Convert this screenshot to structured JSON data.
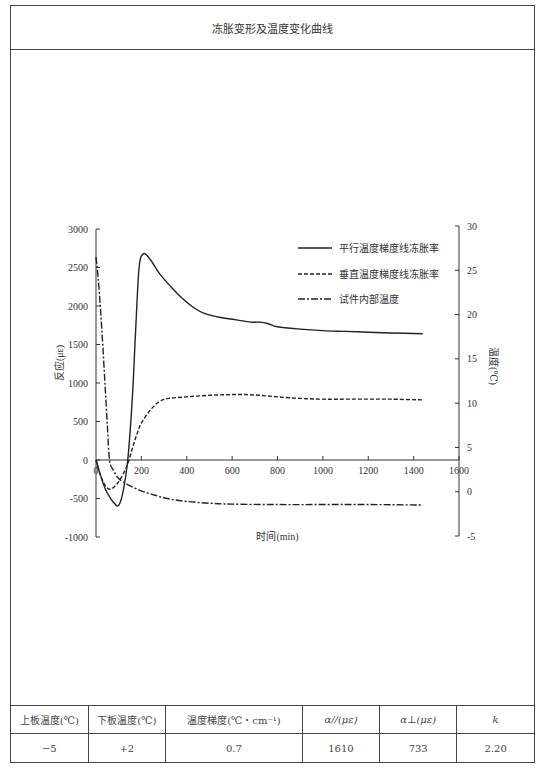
{
  "page": {
    "title": "冻胀变形及温度变化曲线"
  },
  "chart_data": {
    "type": "line",
    "title": "冻胀变形及温度变化曲线",
    "xlabel": "时间(min)",
    "ylabel": "反应(με)",
    "y2label": "温度(℃)",
    "xlim": [
      0,
      1600
    ],
    "ylim": [
      -1000,
      3000
    ],
    "y2lim": [
      -5,
      30
    ],
    "xticks": [
      0,
      200,
      400,
      600,
      800,
      1000,
      1200,
      1400,
      1600
    ],
    "xtick_labels": [
      "0",
      "200",
      "400",
      "600",
      "800",
      "1000",
      "1200",
      "1400",
      "1600"
    ],
    "yticks": [
      -1000,
      -500,
      0,
      500,
      1000,
      1500,
      2000,
      2500,
      3000
    ],
    "ytick_labels": [
      "-1000",
      "-500",
      "0",
      "500",
      "1000",
      "1500",
      "2000",
      "2500",
      "3000"
    ],
    "y2ticks": [
      -5,
      0,
      5,
      10,
      15,
      20,
      25,
      30
    ],
    "y2tick_labels": [
      "-5",
      "0",
      "5",
      "10",
      "15",
      "20",
      "25",
      "30"
    ],
    "grid": false,
    "legend_position": "top-right",
    "series": [
      {
        "name": "平行温度梯度线冻胀率",
        "axis": "left",
        "style": "solid",
        "x": [
          0,
          20,
          40,
          60,
          80,
          100,
          120,
          140,
          160,
          175,
          190,
          210,
          240,
          280,
          330,
          380,
          430,
          480,
          550,
          620,
          680,
          720,
          760,
          800,
          900,
          1000,
          1100,
          1200,
          1300,
          1440
        ],
        "y": [
          0,
          -200,
          -370,
          -480,
          -560,
          -590,
          -400,
          0,
          800,
          1700,
          2500,
          2680,
          2600,
          2420,
          2250,
          2100,
          1980,
          1900,
          1850,
          1820,
          1790,
          1790,
          1770,
          1730,
          1700,
          1680,
          1670,
          1660,
          1650,
          1640
        ]
      },
      {
        "name": "垂直温度梯度线冻胀率",
        "axis": "left",
        "style": "dashed",
        "x": [
          0,
          20,
          40,
          60,
          80,
          100,
          120,
          140,
          160,
          180,
          200,
          240,
          280,
          320,
          400,
          500,
          600,
          660,
          720,
          800,
          900,
          1000,
          1100,
          1200,
          1300,
          1440
        ],
        "y": [
          0,
          -200,
          -330,
          -380,
          -350,
          -280,
          -180,
          -50,
          150,
          330,
          480,
          650,
          760,
          800,
          820,
          840,
          850,
          850,
          840,
          820,
          800,
          790,
          790,
          790,
          790,
          780
        ]
      },
      {
        "name": "试件内部温度",
        "axis": "right",
        "style": "dashdot",
        "x": [
          0,
          10,
          20,
          30,
          40,
          50,
          60,
          80,
          100,
          140,
          200,
          260,
          320,
          400,
          500,
          600,
          800,
          1000,
          1200,
          1440
        ],
        "y": [
          26.5,
          24,
          20.5,
          16.5,
          12,
          7.5,
          3.5,
          2.3,
          1.5,
          0.8,
          0.1,
          -0.4,
          -0.8,
          -1.1,
          -1.3,
          -1.4,
          -1.45,
          -1.45,
          -1.45,
          -1.5
        ]
      }
    ]
  },
  "table": {
    "headers": [
      "上板温度(℃)",
      "下板温度(℃)",
      "温度梯度(℃・cm⁻¹)",
      "α//(με)",
      "α⊥(με)",
      "k"
    ],
    "rows": [
      [
        "−5",
        "+2",
        "0.7",
        "1610",
        "733",
        "2.20"
      ]
    ]
  }
}
